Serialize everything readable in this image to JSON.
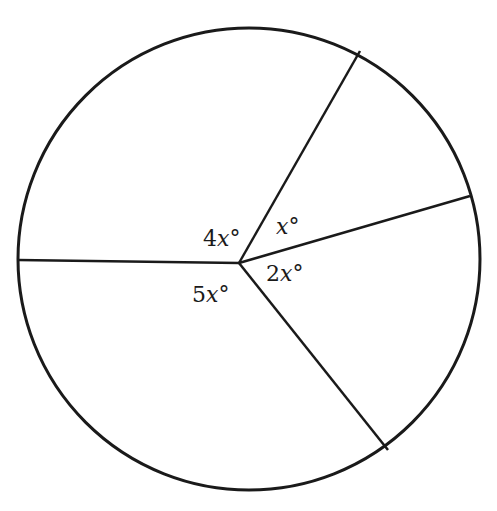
{
  "diagram": {
    "type": "circle-divided-into-sectors",
    "circle": {
      "cx": 249,
      "cy": 259,
      "r": 231,
      "stroke": "#1a1a1a"
    },
    "center": {
      "x": 239,
      "y": 263
    },
    "radii_endpoints": [
      {
        "name": "left",
        "x": 18,
        "y": 260
      },
      {
        "name": "upper-right",
        "x": 360,
        "y": 51
      },
      {
        "name": "right",
        "x": 470,
        "y": 196
      },
      {
        "name": "lower-right",
        "x": 388,
        "y": 450
      }
    ],
    "angles": [
      {
        "id": "angle-4x",
        "coef": "4",
        "var": "x",
        "unit": "°",
        "x": 203,
        "y": 246
      },
      {
        "id": "angle-x",
        "coef": "",
        "var": "x",
        "unit": "°",
        "x": 276,
        "y": 234
      },
      {
        "id": "angle-2x",
        "coef": "2",
        "var": "x",
        "unit": "°",
        "x": 266,
        "y": 281
      },
      {
        "id": "angle-5x",
        "coef": "5",
        "var": "x",
        "unit": "°",
        "x": 192,
        "y": 302
      }
    ]
  }
}
